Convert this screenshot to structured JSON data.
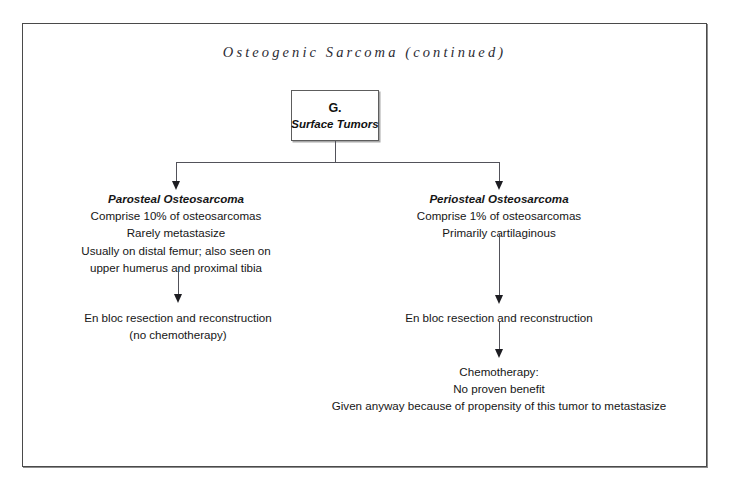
{
  "document": {
    "title": "Osteogenic Sarcoma (continued)",
    "page_background": "#ffffff",
    "frame_color": "#4a4a4a",
    "text_color": "#161616",
    "connector_color": "#52525a"
  },
  "diagram": {
    "type": "flowchart",
    "root": {
      "letter": "G.",
      "label": "Surface Tumors"
    },
    "branches": [
      {
        "id": "parosteal",
        "heading": "Parosteal Osteosarcoma",
        "lines": [
          "Comprise 10% of osteosarcomas",
          "Rarely metastasize",
          "Usually on distal femur; also seen on",
          "upper humerus and proximal tibia"
        ],
        "treatment": {
          "lines": [
            "En bloc resection and reconstruction",
            "(no chemotherapy)"
          ]
        }
      },
      {
        "id": "periosteal",
        "heading": "Periosteal Osteosarcoma",
        "lines": [
          "Comprise 1% of osteosarcomas",
          "Primarily cartilaginous"
        ],
        "treatment": {
          "lines": [
            "En bloc resection and reconstruction"
          ]
        },
        "followup": {
          "lines": [
            "Chemotherapy:",
            "No proven benefit",
            "Given anyway because of propensity of this tumor to metastasize"
          ]
        }
      }
    ]
  }
}
